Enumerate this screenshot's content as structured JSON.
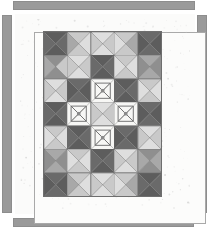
{
  "artwork": {
    "title": "Pieced quilt photograph",
    "type": "quilt-top-image",
    "grid": {
      "columns": 5,
      "rows": 7,
      "block_pattern": "hourglass-x"
    },
    "palette": {
      "background": "#ffffff",
      "quilt_ground": "#fbfbfa",
      "sashing_gray": "#9a9a9a",
      "frame_line": "#a9a9a9",
      "dark": "#5d5d5d",
      "dark_alt": "#6a6a6a",
      "medium": "#8f8f8f",
      "medium_light": "#a8a8a8",
      "light": "#c9c9c9",
      "pale": "#dedede",
      "white": "#f7f7f5",
      "seam": "#6e6e6e"
    },
    "frame_bars": [
      {
        "name": "top",
        "label": "top sashing bar"
      },
      {
        "name": "bottom",
        "label": "bottom sashing bar"
      },
      {
        "name": "left",
        "label": "left sashing bar"
      },
      {
        "name": "right",
        "label": "right sashing bar"
      }
    ],
    "blocks": [
      [
        {
          "id": "r1c1",
          "kind": "x",
          "tone": "dark",
          "n": "dark",
          "e": "dark_alt",
          "s": "dark",
          "w": "dark_alt"
        },
        {
          "id": "r1c2",
          "kind": "x",
          "tone": "light",
          "n": "light",
          "e": "pale",
          "s": "light",
          "w": "medium_light"
        },
        {
          "id": "r1c3",
          "kind": "x",
          "tone": "light",
          "n": "pale",
          "e": "light",
          "s": "pale",
          "w": "light"
        },
        {
          "id": "r1c4",
          "kind": "x",
          "tone": "light",
          "n": "light",
          "e": "medium_light",
          "s": "light",
          "w": "pale"
        },
        {
          "id": "r1c5",
          "kind": "x",
          "tone": "dark",
          "n": "dark_alt",
          "e": "dark",
          "s": "dark_alt",
          "w": "dark"
        }
      ],
      [
        {
          "id": "r2c1",
          "kind": "x",
          "tone": "medium",
          "n": "medium",
          "e": "light",
          "s": "medium",
          "w": "medium_light"
        },
        {
          "id": "r2c2",
          "kind": "x",
          "tone": "light",
          "n": "pale",
          "e": "light",
          "s": "pale",
          "w": "light"
        },
        {
          "id": "r2c3",
          "kind": "x",
          "tone": "dark",
          "n": "dark",
          "e": "dark_alt",
          "s": "dark",
          "w": "dark_alt"
        },
        {
          "id": "r2c4",
          "kind": "x",
          "tone": "light",
          "n": "light",
          "e": "pale",
          "s": "light",
          "w": "pale"
        },
        {
          "id": "r2c5",
          "kind": "x",
          "tone": "medium",
          "n": "medium_light",
          "e": "medium",
          "s": "medium_light",
          "w": "medium"
        }
      ],
      [
        {
          "id": "r3c1",
          "kind": "x",
          "tone": "light",
          "n": "pale",
          "e": "light",
          "s": "pale",
          "w": "light"
        },
        {
          "id": "r3c2",
          "kind": "x",
          "tone": "dark",
          "n": "dark_alt",
          "e": "dark",
          "s": "dark_alt",
          "w": "dark"
        },
        {
          "id": "r3c3",
          "kind": "bowtie",
          "tone": "white",
          "n": "white",
          "e": "white",
          "s": "white",
          "w": "white"
        },
        {
          "id": "r3c4",
          "kind": "x",
          "tone": "dark",
          "n": "dark",
          "e": "dark_alt",
          "s": "dark",
          "w": "dark_alt"
        },
        {
          "id": "r3c5",
          "kind": "x",
          "tone": "light",
          "n": "light",
          "e": "pale",
          "s": "light",
          "w": "pale"
        }
      ],
      [
        {
          "id": "r4c1",
          "kind": "x",
          "tone": "dark",
          "n": "dark",
          "e": "dark_alt",
          "s": "dark",
          "w": "dark_alt"
        },
        {
          "id": "r4c2",
          "kind": "bowtie",
          "tone": "white",
          "n": "white",
          "e": "white",
          "s": "white",
          "w": "white"
        },
        {
          "id": "r4c3",
          "kind": "x",
          "tone": "light",
          "n": "pale",
          "e": "light",
          "s": "pale",
          "w": "light"
        },
        {
          "id": "r4c4",
          "kind": "bowtie",
          "tone": "white",
          "n": "white",
          "e": "white",
          "s": "white",
          "w": "white"
        },
        {
          "id": "r4c5",
          "kind": "x",
          "tone": "dark",
          "n": "dark_alt",
          "e": "dark",
          "s": "dark_alt",
          "w": "dark"
        }
      ],
      [
        {
          "id": "r5c1",
          "kind": "x",
          "tone": "light",
          "n": "light",
          "e": "pale",
          "s": "light",
          "w": "pale"
        },
        {
          "id": "r5c2",
          "kind": "x",
          "tone": "dark",
          "n": "dark",
          "e": "dark_alt",
          "s": "dark",
          "w": "dark_alt"
        },
        {
          "id": "r5c3",
          "kind": "bowtie",
          "tone": "white",
          "n": "white",
          "e": "white",
          "s": "white",
          "w": "white"
        },
        {
          "id": "r5c4",
          "kind": "x",
          "tone": "dark",
          "n": "dark_alt",
          "e": "dark",
          "s": "dark_alt",
          "w": "dark"
        },
        {
          "id": "r5c5",
          "kind": "x",
          "tone": "light",
          "n": "pale",
          "e": "light",
          "s": "pale",
          "w": "light"
        }
      ],
      [
        {
          "id": "r6c1",
          "kind": "x",
          "tone": "medium",
          "n": "medium_light",
          "e": "medium",
          "s": "medium_light",
          "w": "medium"
        },
        {
          "id": "r6c2",
          "kind": "x",
          "tone": "light",
          "n": "light",
          "e": "pale",
          "s": "light",
          "w": "pale"
        },
        {
          "id": "r6c3",
          "kind": "x",
          "tone": "dark",
          "n": "dark",
          "e": "dark_alt",
          "s": "dark",
          "w": "dark_alt"
        },
        {
          "id": "r6c4",
          "kind": "x",
          "tone": "light",
          "n": "pale",
          "e": "light",
          "s": "pale",
          "w": "light"
        },
        {
          "id": "r6c5",
          "kind": "x",
          "tone": "medium",
          "n": "medium",
          "e": "medium_light",
          "s": "medium",
          "w": "medium_light"
        }
      ],
      [
        {
          "id": "r7c1",
          "kind": "x",
          "tone": "dark",
          "n": "dark_alt",
          "e": "dark",
          "s": "dark_alt",
          "w": "dark"
        },
        {
          "id": "r7c2",
          "kind": "x",
          "tone": "light",
          "n": "light",
          "e": "pale",
          "s": "light",
          "w": "medium_light"
        },
        {
          "id": "r7c3",
          "kind": "x",
          "tone": "light",
          "n": "pale",
          "e": "light",
          "s": "pale",
          "w": "light"
        },
        {
          "id": "r7c4",
          "kind": "x",
          "tone": "light",
          "n": "light",
          "e": "medium_light",
          "s": "light",
          "w": "pale"
        },
        {
          "id": "r7c5",
          "kind": "x",
          "tone": "dark",
          "n": "dark",
          "e": "dark_alt",
          "s": "dark",
          "w": "dark_alt"
        }
      ]
    ]
  }
}
